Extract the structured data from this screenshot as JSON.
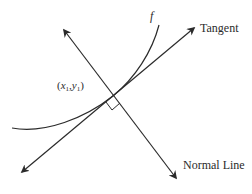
{
  "diagram": {
    "labels": {
      "curve": "f",
      "tangent": "Tangent",
      "normal": "Normal Line",
      "point": {
        "open": "(",
        "x": "x",
        "x_sub": "1",
        "comma": ",",
        "y": "y",
        "y_sub": "1",
        "close": ")"
      }
    },
    "colors": {
      "stroke": "#2b2b2b",
      "background": "#ffffff"
    },
    "geometry": {
      "point_of_tangency": [
        113,
        96
      ],
      "tangent_line": {
        "from": [
          22,
          172
        ],
        "to": [
          194,
          28
        ]
      },
      "normal_line": {
        "from": [
          64,
          30
        ],
        "to": [
          176,
          178
        ]
      },
      "curve_start": [
        12,
        128
      ],
      "curve_end": [
        159,
        25
      ],
      "right_angle_marker": true
    }
  }
}
